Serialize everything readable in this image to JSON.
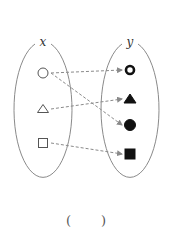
{
  "diagram": {
    "type": "mapping",
    "domain_set": {
      "label": "x",
      "elements": [
        {
          "id": "open-circle",
          "shape": "circle",
          "fill": "none"
        },
        {
          "id": "open-triangle",
          "shape": "triangle",
          "fill": "none"
        },
        {
          "id": "open-square",
          "shape": "square",
          "fill": "none"
        }
      ]
    },
    "codomain_set": {
      "label": "y",
      "elements": [
        {
          "id": "bold-ring",
          "shape": "ring",
          "fill": "none"
        },
        {
          "id": "filled-triangle",
          "shape": "triangle",
          "fill": "solid"
        },
        {
          "id": "filled-circle",
          "shape": "circle",
          "fill": "solid"
        },
        {
          "id": "filled-square",
          "shape": "square",
          "fill": "solid"
        }
      ]
    },
    "arrows": [
      {
        "from": "open-circle",
        "to": "bold-ring"
      },
      {
        "from": "open-circle",
        "to": "filled-circle"
      },
      {
        "from": "open-triangle",
        "to": "filled-triangle"
      },
      {
        "from": "open-square",
        "to": "filled-square"
      }
    ],
    "colors": {
      "outline": "#8a8a8a",
      "arrow": "#8a8a8a",
      "solid": "#111111",
      "open_shape": "#555555"
    }
  },
  "answer": {
    "open_paren": "(",
    "close_paren": ")"
  }
}
